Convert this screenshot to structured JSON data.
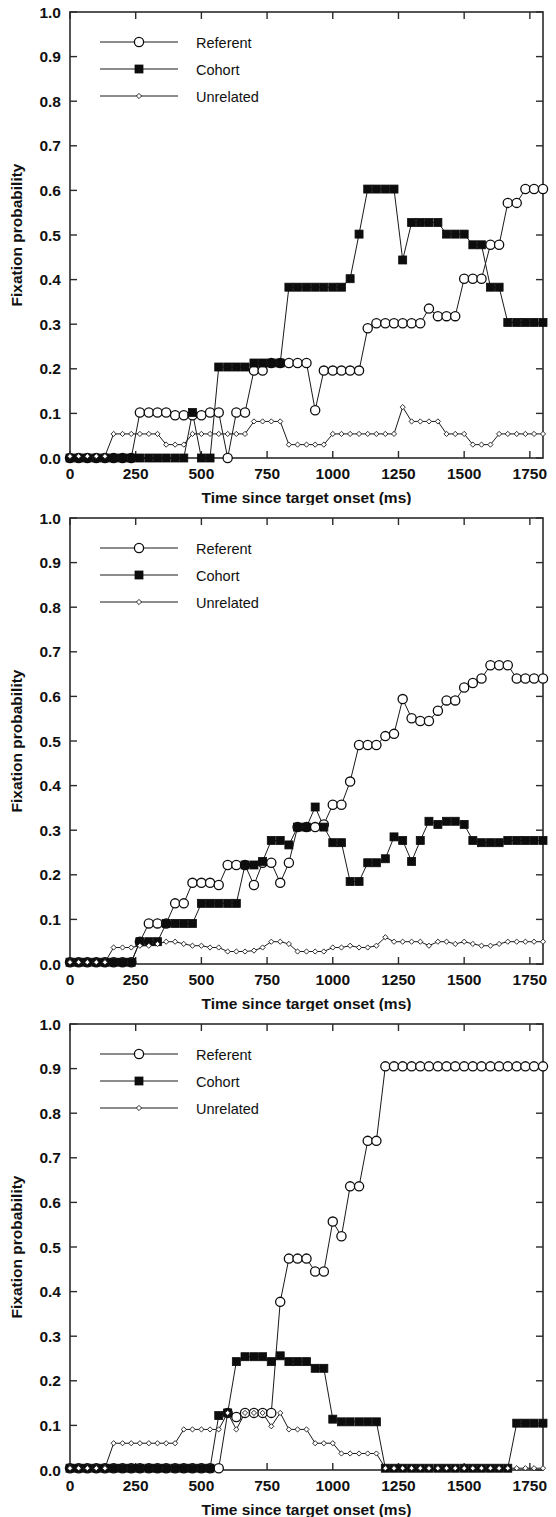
{
  "figure": {
    "panel_count": 3,
    "background_color": "#ffffff",
    "ink_color": "#111111"
  },
  "axes": {
    "ylabel": "Fixation probability",
    "xlabel": "Time since target onset (ms)",
    "ylim": [
      0.0,
      1.0
    ],
    "xlim": [
      0,
      1800
    ],
    "ytick_labels": [
      "0.0",
      "0.1",
      "0.2",
      "0.3",
      "0.4",
      "0.5",
      "0.6",
      "0.7",
      "0.8",
      "0.9",
      "1.0"
    ],
    "ytick_values": [
      0.0,
      0.1,
      0.2,
      0.3,
      0.4,
      0.5,
      0.6,
      0.7,
      0.8,
      0.9,
      1.0
    ],
    "xtick_labels": [
      "0",
      "250",
      "500",
      "750",
      "1000",
      "1250",
      "1500",
      "1750"
    ],
    "xtick_values": [
      0,
      250,
      500,
      750,
      1000,
      1250,
      1500,
      1750
    ],
    "grid": false
  },
  "legend": {
    "position": "top-left",
    "entries": [
      {
        "label": "Referent",
        "marker": "open-circle"
      },
      {
        "label": "Cohort",
        "marker": "filled-square"
      },
      {
        "label": "Unrelated",
        "marker": "small-diamond"
      }
    ]
  },
  "chart_data": [
    {
      "type": "line",
      "panel": "top",
      "title": "",
      "xlabel": "Time since target onset (ms)",
      "ylabel": "Fixation probability",
      "xlim": [
        0,
        1800
      ],
      "ylim": [
        0.0,
        1.0
      ],
      "grid": false,
      "legend_position": "top-left",
      "x": [
        0,
        33,
        66,
        100,
        133,
        166,
        200,
        233,
        266,
        300,
        333,
        366,
        400,
        433,
        466,
        500,
        533,
        566,
        600,
        633,
        666,
        700,
        733,
        766,
        800,
        833,
        866,
        900,
        933,
        966,
        1000,
        1033,
        1066,
        1100,
        1133,
        1166,
        1200,
        1233,
        1266,
        1300,
        1333,
        1366,
        1400,
        1433,
        1466,
        1500,
        1533,
        1566,
        1600,
        1633,
        1666,
        1700,
        1733,
        1766,
        1800
      ],
      "series": [
        {
          "name": "Referent",
          "marker": "open-circle",
          "values": [
            0.0,
            0.0,
            0.0,
            0.0,
            0.0,
            0.0,
            0.0,
            0.0,
            0.102,
            0.102,
            0.102,
            0.102,
            0.096,
            0.096,
            0.096,
            0.096,
            0.102,
            0.102,
            0.0,
            0.102,
            0.102,
            0.196,
            0.196,
            0.213,
            0.213,
            0.213,
            0.213,
            0.213,
            0.107,
            0.196,
            0.196,
            0.196,
            0.196,
            0.196,
            0.291,
            0.302,
            0.302,
            0.302,
            0.302,
            0.302,
            0.302,
            0.335,
            0.318,
            0.318,
            0.318,
            0.402,
            0.402,
            0.402,
            0.478,
            0.478,
            0.572,
            0.572,
            0.603,
            0.603,
            0.603
          ]
        },
        {
          "name": "Cohort",
          "marker": "filled-square",
          "values": [
            0.0,
            0.0,
            0.0,
            0.0,
            0.0,
            0.0,
            0.0,
            0.0,
            0.0,
            0.0,
            0.0,
            0.0,
            0.0,
            0.0,
            0.102,
            0.0,
            0.0,
            0.204,
            0.204,
            0.204,
            0.204,
            0.213,
            0.213,
            0.213,
            0.213,
            0.383,
            0.383,
            0.383,
            0.383,
            0.383,
            0.383,
            0.383,
            0.402,
            0.502,
            0.603,
            0.603,
            0.603,
            0.603,
            0.444,
            0.528,
            0.528,
            0.528,
            0.528,
            0.502,
            0.502,
            0.502,
            0.478,
            0.478,
            0.383,
            0.383,
            0.304,
            0.304,
            0.304,
            0.304,
            0.304
          ]
        },
        {
          "name": "Unrelated",
          "marker": "small-diamond",
          "values": [
            0.004,
            0.004,
            0.004,
            0.004,
            0.004,
            0.054,
            0.054,
            0.054,
            0.054,
            0.054,
            0.054,
            0.03,
            0.03,
            0.03,
            0.054,
            0.054,
            0.054,
            0.054,
            0.054,
            0.054,
            0.054,
            0.082,
            0.082,
            0.082,
            0.082,
            0.03,
            0.03,
            0.03,
            0.03,
            0.03,
            0.054,
            0.054,
            0.054,
            0.054,
            0.054,
            0.054,
            0.054,
            0.054,
            0.114,
            0.082,
            0.082,
            0.082,
            0.082,
            0.054,
            0.054,
            0.054,
            0.03,
            0.03,
            0.03,
            0.054,
            0.054,
            0.054,
            0.054,
            0.054,
            0.054
          ]
        }
      ]
    },
    {
      "type": "line",
      "panel": "middle",
      "title": "",
      "xlabel": "Time since target onset (ms)",
      "ylabel": "Fixation probability",
      "xlim": [
        0,
        1800
      ],
      "ylim": [
        0.0,
        1.0
      ],
      "grid": false,
      "legend_position": "top-left",
      "x": [
        0,
        33,
        66,
        100,
        133,
        166,
        200,
        233,
        266,
        300,
        333,
        366,
        400,
        433,
        466,
        500,
        533,
        566,
        600,
        633,
        666,
        700,
        733,
        766,
        800,
        833,
        866,
        900,
        933,
        966,
        1000,
        1033,
        1066,
        1100,
        1133,
        1166,
        1200,
        1233,
        1266,
        1300,
        1333,
        1366,
        1400,
        1433,
        1466,
        1500,
        1533,
        1566,
        1600,
        1633,
        1666,
        1700,
        1733,
        1766,
        1800
      ],
      "series": [
        {
          "name": "Referent",
          "marker": "open-circle",
          "values": [
            0.004,
            0.004,
            0.004,
            0.004,
            0.004,
            0.004,
            0.004,
            0.004,
            0.05,
            0.091,
            0.091,
            0.091,
            0.136,
            0.136,
            0.182,
            0.182,
            0.182,
            0.177,
            0.222,
            0.222,
            0.222,
            0.177,
            0.227,
            0.227,
            0.182,
            0.227,
            0.307,
            0.307,
            0.307,
            0.313,
            0.357,
            0.357,
            0.409,
            0.491,
            0.491,
            0.491,
            0.511,
            0.516,
            0.594,
            0.551,
            0.545,
            0.545,
            0.568,
            0.591,
            0.591,
            0.62,
            0.63,
            0.64,
            0.67,
            0.67,
            0.67,
            0.64,
            0.64,
            0.64,
            0.64
          ]
        },
        {
          "name": "Cohort",
          "marker": "filled-square",
          "values": [
            0.004,
            0.004,
            0.004,
            0.004,
            0.004,
            0.004,
            0.004,
            0.004,
            0.05,
            0.05,
            0.05,
            0.091,
            0.091,
            0.091,
            0.091,
            0.136,
            0.136,
            0.136,
            0.136,
            0.136,
            0.222,
            0.222,
            0.23,
            0.277,
            0.277,
            0.267,
            0.307,
            0.307,
            0.352,
            0.307,
            0.272,
            0.272,
            0.185,
            0.185,
            0.227,
            0.227,
            0.236,
            0.285,
            0.277,
            0.23,
            0.277,
            0.32,
            0.313,
            0.32,
            0.32,
            0.313,
            0.277,
            0.272,
            0.272,
            0.272,
            0.277,
            0.277,
            0.277,
            0.277,
            0.277
          ]
        },
        {
          "name": "Unrelated",
          "marker": "small-diamond",
          "values": [
            0.004,
            0.004,
            0.004,
            0.004,
            0.004,
            0.037,
            0.037,
            0.037,
            0.041,
            0.041,
            0.045,
            0.05,
            0.05,
            0.045,
            0.041,
            0.041,
            0.037,
            0.037,
            0.028,
            0.028,
            0.028,
            0.03,
            0.037,
            0.05,
            0.05,
            0.045,
            0.028,
            0.028,
            0.028,
            0.028,
            0.037,
            0.037,
            0.041,
            0.037,
            0.037,
            0.041,
            0.06,
            0.05,
            0.05,
            0.05,
            0.05,
            0.041,
            0.05,
            0.05,
            0.045,
            0.05,
            0.045,
            0.041,
            0.041,
            0.045,
            0.05,
            0.05,
            0.05,
            0.05,
            0.05
          ]
        }
      ]
    },
    {
      "type": "line",
      "panel": "bottom",
      "title": "",
      "xlabel": "Time since target onset (ms)",
      "ylabel": "Fixation probability",
      "xlim": [
        0,
        1800
      ],
      "ylim": [
        0.0,
        1.0
      ],
      "grid": false,
      "legend_position": "top-left",
      "x": [
        0,
        33,
        66,
        100,
        133,
        166,
        200,
        233,
        266,
        300,
        333,
        366,
        400,
        433,
        466,
        500,
        533,
        566,
        600,
        633,
        666,
        700,
        733,
        766,
        800,
        833,
        866,
        900,
        933,
        966,
        1000,
        1033,
        1066,
        1100,
        1133,
        1166,
        1200,
        1233,
        1266,
        1300,
        1333,
        1366,
        1400,
        1433,
        1466,
        1500,
        1533,
        1566,
        1600,
        1633,
        1666,
        1700,
        1733,
        1766,
        1800
      ],
      "values_note": "Referent rises sharply after 600 ms to a 0.905 plateau from 1200 ms onward",
      "series": [
        {
          "name": "Referent",
          "marker": "open-circle",
          "values": [
            0.004,
            0.004,
            0.004,
            0.004,
            0.004,
            0.004,
            0.004,
            0.004,
            0.004,
            0.004,
            0.004,
            0.004,
            0.004,
            0.004,
            0.004,
            0.004,
            0.004,
            0.004,
            0.128,
            0.119,
            0.128,
            0.128,
            0.128,
            0.128,
            0.377,
            0.474,
            0.474,
            0.474,
            0.445,
            0.445,
            0.557,
            0.524,
            0.636,
            0.636,
            0.738,
            0.738,
            0.905,
            0.905,
            0.905,
            0.905,
            0.905,
            0.905,
            0.905,
            0.905,
            0.905,
            0.905,
            0.905,
            0.905,
            0.905,
            0.905,
            0.905,
            0.905,
            0.905,
            0.905,
            0.905
          ]
        },
        {
          "name": "Cohort",
          "marker": "filled-square",
          "values": [
            0.004,
            0.004,
            0.004,
            0.004,
            0.004,
            0.004,
            0.004,
            0.004,
            0.004,
            0.004,
            0.004,
            0.004,
            0.004,
            0.004,
            0.004,
            0.004,
            0.004,
            0.122,
            0.128,
            0.243,
            0.254,
            0.254,
            0.254,
            0.243,
            0.256,
            0.243,
            0.243,
            0.243,
            0.228,
            0.228,
            0.114,
            0.108,
            0.108,
            0.108,
            0.108,
            0.108,
            0.004,
            0.004,
            0.004,
            0.004,
            0.004,
            0.004,
            0.004,
            0.004,
            0.004,
            0.004,
            0.004,
            0.004,
            0.004,
            0.004,
            0.004,
            0.105,
            0.105,
            0.105,
            0.105
          ]
        },
        {
          "name": "Unrelated",
          "marker": "small-diamond",
          "values": [
            0.004,
            0.004,
            0.004,
            0.004,
            0.004,
            0.06,
            0.06,
            0.06,
            0.06,
            0.06,
            0.06,
            0.06,
            0.06,
            0.091,
            0.091,
            0.091,
            0.091,
            0.091,
            0.128,
            0.091,
            0.128,
            0.128,
            0.128,
            0.098,
            0.128,
            0.091,
            0.091,
            0.091,
            0.06,
            0.06,
            0.06,
            0.037,
            0.037,
            0.037,
            0.037,
            0.037,
            0.004,
            0.004,
            0.004,
            0.004,
            0.004,
            0.004,
            0.004,
            0.004,
            0.004,
            0.004,
            0.004,
            0.004,
            0.004,
            0.004,
            0.004,
            0.004,
            0.004,
            0.004,
            0.004
          ]
        }
      ]
    }
  ]
}
